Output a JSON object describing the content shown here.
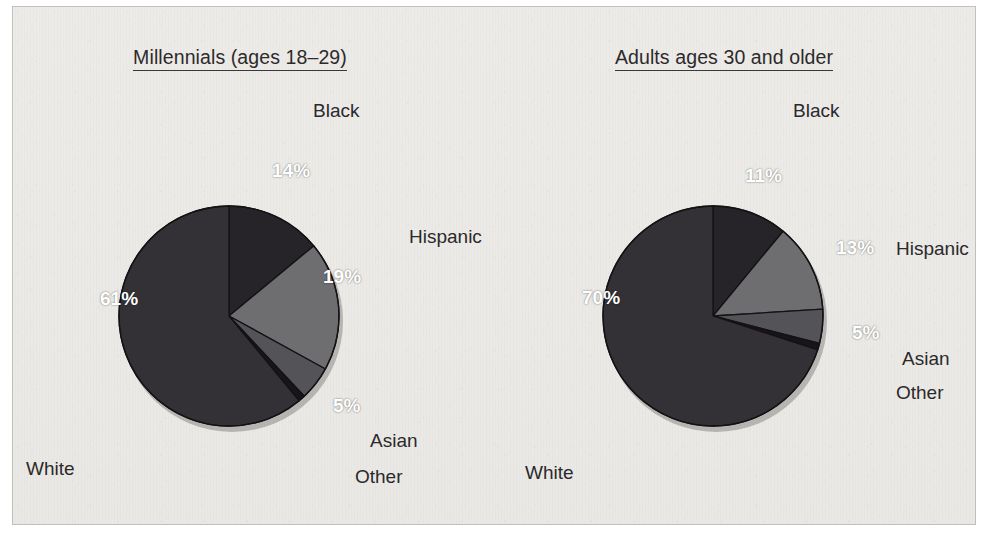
{
  "figure": {
    "background_color": "#eceae6",
    "border_color": "#a09e9a"
  },
  "palette": {
    "white_slice": "#333135",
    "black_slice": "#262428",
    "hispanic_slice": "#6e6e70",
    "asian_slice": "#545458",
    "other_slice": "#17151a",
    "slice_outline": "#141214",
    "label_text": "#2b292b",
    "pct_text": "#ffffff"
  },
  "charts": [
    {
      "id": "millennials",
      "title": "Millennials (ages 18–29)",
      "center": {
        "x": 229,
        "y": 316
      },
      "radius": 110,
      "slices": [
        {
          "name": "Black",
          "value": 14,
          "pct_text": "14%",
          "color": "#262428",
          "pct_pos": {
            "x": 272,
            "y": 160
          },
          "cat_pos": {
            "x": 313,
            "y": 100
          }
        },
        {
          "name": "Hispanic",
          "value": 19,
          "pct_text": "19%",
          "color": "#6e6e70",
          "pct_pos": {
            "x": 323,
            "y": 266
          },
          "cat_pos": {
            "x": 409,
            "y": 226
          }
        },
        {
          "name": "Asian",
          "value": 5,
          "pct_text": "5%",
          "color": "#545458",
          "pct_pos": {
            "x": 333,
            "y": 395
          },
          "cat_pos": {
            "x": 370,
            "y": 430
          }
        },
        {
          "name": "Other",
          "value": 1,
          "pct_text": "",
          "color": "#17151a",
          "pct_pos": null,
          "cat_pos": {
            "x": 355,
            "y": 466
          }
        },
        {
          "name": "White",
          "value": 61,
          "pct_text": "61%",
          "color": "#333135",
          "pct_pos": {
            "x": 100,
            "y": 288
          },
          "cat_pos": {
            "x": 26,
            "y": 458
          }
        }
      ]
    },
    {
      "id": "adults30plus",
      "title": "Adults ages 30 and older",
      "center": {
        "x": 713,
        "y": 316
      },
      "radius": 110,
      "slices": [
        {
          "name": "Black",
          "value": 11,
          "pct_text": "11%",
          "color": "#262428",
          "pct_pos": {
            "x": 745,
            "y": 165
          },
          "cat_pos": {
            "x": 793,
            "y": 100
          }
        },
        {
          "name": "Hispanic",
          "value": 13,
          "pct_text": "13%",
          "color": "#6e6e70",
          "pct_pos": {
            "x": 836,
            "y": 237
          },
          "cat_pos": {
            "x": 896,
            "y": 238
          }
        },
        {
          "name": "Asian",
          "value": 5,
          "pct_text": "5%",
          "color": "#545458",
          "pct_pos": {
            "x": 852,
            "y": 322
          },
          "cat_pos": {
            "x": 902,
            "y": 348
          }
        },
        {
          "name": "Other",
          "value": 1,
          "pct_text": "",
          "color": "#17151a",
          "pct_pos": null,
          "cat_pos": {
            "x": 896,
            "y": 382
          }
        },
        {
          "name": "White",
          "value": 70,
          "pct_text": "70%",
          "color": "#333135",
          "pct_pos": {
            "x": 582,
            "y": 287
          },
          "cat_pos": {
            "x": 525,
            "y": 462
          }
        }
      ]
    }
  ],
  "chart_data": {
    "type": "pie",
    "xlabel": "",
    "ylabel": "",
    "unit": "percent",
    "legend": "inline labels",
    "categories": [
      "White",
      "Black",
      "Hispanic",
      "Asian",
      "Other"
    ],
    "series": [
      {
        "name": "Millennials (ages 18–29)",
        "values": [
          61,
          14,
          19,
          5,
          1
        ],
        "labels": [
          "61%",
          "14%",
          "19%",
          "5%",
          ""
        ]
      },
      {
        "name": "Adults ages 30 and older",
        "values": [
          70,
          11,
          13,
          5,
          1
        ],
        "labels": [
          "70%",
          "11%",
          "13%",
          "5%",
          ""
        ]
      }
    ]
  }
}
